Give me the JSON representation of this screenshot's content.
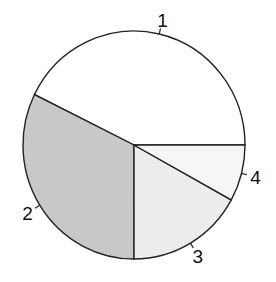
{
  "chart_data": {
    "type": "pie",
    "title": "",
    "labels": [
      "1",
      "2",
      "3",
      "4"
    ],
    "values": [
      42.7,
      32.3,
      17.0,
      8.0
    ],
    "colors": [
      "#ffffff",
      "#c8c8c8",
      "#ececec",
      "#f6f6f6"
    ],
    "start_angle_deg": 0,
    "direction": "counterclockwise",
    "legend": "none",
    "border_color": "#222222"
  }
}
